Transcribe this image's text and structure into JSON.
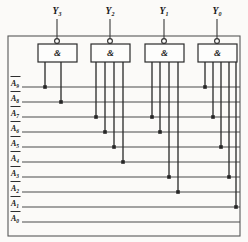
{
  "diagram": {
    "frame": {
      "x": 8,
      "y": 36,
      "width": 232,
      "height": 200
    },
    "colors": {
      "wire": "#3a3a3a",
      "gate_stroke": "#2b2b2b",
      "gate_fill": "#fdfdfc",
      "junction": "#262626",
      "text": "#161616",
      "background": "#fbfaf8"
    },
    "outputs": [
      {
        "name": "Y3",
        "letter": "Y",
        "subscript": "3",
        "x": 57,
        "label_y": 14,
        "stem_top": 19,
        "stem_bottom": 41
      },
      {
        "name": "Y2",
        "letter": "Y",
        "subscript": "2",
        "x": 110,
        "label_y": 14,
        "stem_top": 19,
        "stem_bottom": 41
      },
      {
        "name": "Y1",
        "letter": "Y",
        "subscript": "1",
        "x": 164,
        "label_y": 14,
        "stem_top": 19,
        "stem_bottom": 41
      },
      {
        "name": "Y0",
        "letter": "Y",
        "subscript": "0",
        "x": 217,
        "label_y": 14,
        "stem_top": 19,
        "stem_bottom": 41
      }
    ],
    "gates": [
      {
        "name": "nand-gate-y3",
        "symbol": "&",
        "output": "Y3",
        "x": 38,
        "y": 44,
        "width": 39,
        "height": 18,
        "bubble_cx": 57,
        "bubble_cy": 41,
        "bubble_r": 2.4
      },
      {
        "name": "nand-gate-y2",
        "symbol": "&",
        "output": "Y2",
        "x": 91,
        "y": 44,
        "width": 39,
        "height": 18,
        "bubble_cx": 110,
        "bubble_cy": 41,
        "bubble_r": 2.4
      },
      {
        "name": "nand-gate-y1",
        "symbol": "&",
        "output": "Y1",
        "x": 145,
        "y": 44,
        "width": 39,
        "height": 18,
        "bubble_cx": 164,
        "bubble_cy": 41,
        "bubble_r": 2.4
      },
      {
        "name": "nand-gate-y0",
        "symbol": "&",
        "output": "Y0",
        "x": 198,
        "y": 44,
        "width": 39,
        "height": 18,
        "bubble_cx": 217,
        "bubble_cy": 41,
        "bubble_r": 2.4
      }
    ],
    "input_lines": [
      {
        "name": "A9",
        "letter": "A",
        "subscript": "9",
        "overbar": true,
        "y": 87,
        "label_x": 11,
        "line_x1": 22,
        "line_x2": 240
      },
      {
        "name": "A8",
        "letter": "A",
        "subscript": "8",
        "overbar": true,
        "y": 102,
        "label_x": 11,
        "line_x1": 22,
        "line_x2": 240
      },
      {
        "name": "A7",
        "letter": "A",
        "subscript": "7",
        "overbar": true,
        "y": 117,
        "label_x": 11,
        "line_x1": 22,
        "line_x2": 240
      },
      {
        "name": "A6",
        "letter": "A",
        "subscript": "6",
        "overbar": true,
        "y": 132,
        "label_x": 11,
        "line_x1": 22,
        "line_x2": 240
      },
      {
        "name": "A5",
        "letter": "A",
        "subscript": "5",
        "overbar": true,
        "y": 147,
        "label_x": 11,
        "line_x1": 22,
        "line_x2": 240
      },
      {
        "name": "A4",
        "letter": "A",
        "subscript": "4",
        "overbar": true,
        "y": 162,
        "label_x": 11,
        "line_x1": 22,
        "line_x2": 240
      },
      {
        "name": "A3",
        "letter": "A",
        "subscript": "3",
        "overbar": true,
        "y": 177,
        "label_x": 11,
        "line_x1": 22,
        "line_x2": 240
      },
      {
        "name": "A2",
        "letter": "A",
        "subscript": "2",
        "overbar": true,
        "y": 192,
        "label_x": 11,
        "line_x1": 22,
        "line_x2": 240
      },
      {
        "name": "A1",
        "letter": "A",
        "subscript": "1",
        "overbar": true,
        "y": 207,
        "label_x": 11,
        "line_x1": 22,
        "line_x2": 240
      },
      {
        "name": "A0",
        "letter": "A",
        "subscript": "0",
        "overbar": true,
        "y": 222,
        "label_x": 11,
        "line_x1": 22,
        "line_x2": 240
      }
    ],
    "drops": [
      {
        "name": "drop-y3-a9",
        "gate": "Y3",
        "input": "A9",
        "x": 45,
        "y_top": 62,
        "y_end": 87
      },
      {
        "name": "drop-y3-a8",
        "gate": "Y3",
        "input": "A8",
        "x": 61,
        "y_top": 62,
        "y_end": 102
      },
      {
        "name": "drop-y2-a7",
        "gate": "Y2",
        "input": "A7",
        "x": 96,
        "y_top": 62,
        "y_end": 117
      },
      {
        "name": "drop-y2-a6",
        "gate": "Y2",
        "input": "A6",
        "x": 105,
        "y_top": 62,
        "y_end": 132
      },
      {
        "name": "drop-y2-a5",
        "gate": "Y2",
        "input": "A5",
        "x": 114,
        "y_top": 62,
        "y_end": 147
      },
      {
        "name": "drop-y2-a4",
        "gate": "Y2",
        "input": "A4",
        "x": 123,
        "y_top": 62,
        "y_end": 162
      },
      {
        "name": "drop-y1-a7",
        "gate": "Y1",
        "input": "A7",
        "x": 152,
        "y_top": 62,
        "y_end": 117
      },
      {
        "name": "drop-y1-a6",
        "gate": "Y1",
        "input": "A6",
        "x": 160,
        "y_top": 62,
        "y_end": 132
      },
      {
        "name": "drop-y1-a3",
        "gate": "Y1",
        "input": "A3",
        "x": 169,
        "y_top": 62,
        "y_end": 177
      },
      {
        "name": "drop-y1-a2",
        "gate": "Y1",
        "input": "A2",
        "x": 178,
        "y_top": 62,
        "y_end": 192
      },
      {
        "name": "drop-y0-a9",
        "gate": "Y0",
        "input": "A9",
        "x": 205,
        "y_top": 62,
        "y_end": 87
      },
      {
        "name": "drop-y0-a7",
        "gate": "Y0",
        "input": "A7",
        "x": 213,
        "y_top": 62,
        "y_end": 117
      },
      {
        "name": "drop-y0-a5",
        "gate": "Y0",
        "input": "A5",
        "x": 221,
        "y_top": 62,
        "y_end": 147
      },
      {
        "name": "drop-y0-a3",
        "gate": "Y0",
        "input": "A3",
        "x": 229,
        "y_top": 62,
        "y_end": 177
      },
      {
        "name": "drop-y0-a1",
        "gate": "Y0",
        "input": "A1",
        "x": 236,
        "y_top": 62,
        "y_end": 207
      }
    ],
    "junctions": [
      {
        "name": "junction-y3-a9",
        "x": 45,
        "y": 87
      },
      {
        "name": "junction-y3-a8",
        "x": 61,
        "y": 102
      },
      {
        "name": "junction-y2-a7",
        "x": 96,
        "y": 117
      },
      {
        "name": "junction-y2-a6",
        "x": 105,
        "y": 132
      },
      {
        "name": "junction-y2-a5",
        "x": 114,
        "y": 147
      },
      {
        "name": "junction-y2-a4",
        "x": 123,
        "y": 162
      },
      {
        "name": "junction-y1-a7",
        "x": 152,
        "y": 117
      },
      {
        "name": "junction-y1-a6",
        "x": 160,
        "y": 132
      },
      {
        "name": "junction-y1-a3",
        "x": 169,
        "y": 177
      },
      {
        "name": "junction-y1-a2",
        "x": 178,
        "y": 192
      },
      {
        "name": "junction-y0-a9",
        "x": 205,
        "y": 87
      },
      {
        "name": "junction-y0-a7",
        "x": 213,
        "y": 117
      },
      {
        "name": "junction-y0-a5",
        "x": 221,
        "y": 147
      },
      {
        "name": "junction-y0-a3",
        "x": 229,
        "y": 177
      },
      {
        "name": "junction-y0-a1",
        "x": 236,
        "y": 207
      }
    ]
  }
}
